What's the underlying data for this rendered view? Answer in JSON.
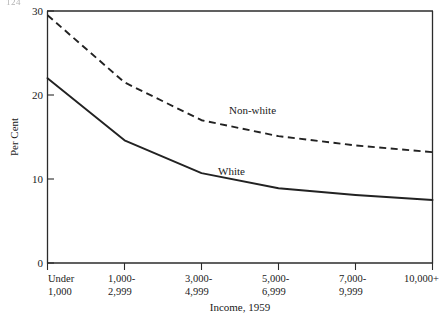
{
  "page": {
    "folio": "124"
  },
  "chart_data": {
    "type": "line",
    "title": "",
    "xlabel": "Income, 1959",
    "ylabel": "Per Cent",
    "categories": [
      "Under 1,000",
      "1,000-2,999",
      "3,000-4,999",
      "5,000-6,999",
      "7,000-9,999",
      "10,000+"
    ],
    "category_lines": [
      [
        "Under",
        "1,000"
      ],
      [
        "1,000-",
        "2,999"
      ],
      [
        "3,000-",
        "4,999"
      ],
      [
        "5,000-",
        "6,999"
      ],
      [
        "7,000-",
        "9,999"
      ],
      [
        "10,000+",
        ""
      ]
    ],
    "ylim": [
      0,
      30
    ],
    "yticks": [
      0,
      10,
      20,
      30
    ],
    "ytick_labels": [
      "0",
      "10",
      "20",
      "30"
    ],
    "grid": false,
    "legend": "inline-labels",
    "series": [
      {
        "name": "Non-white",
        "style": "dashed",
        "color": "#222222",
        "values": [
          29.5,
          21.5,
          17.0,
          15.1,
          14.0,
          13.2
        ],
        "label_text": "Non-white"
      },
      {
        "name": "White",
        "style": "solid",
        "color": "#222222",
        "values": [
          22.0,
          14.6,
          10.7,
          8.9,
          8.1,
          7.5
        ],
        "label_text": "White"
      }
    ]
  }
}
